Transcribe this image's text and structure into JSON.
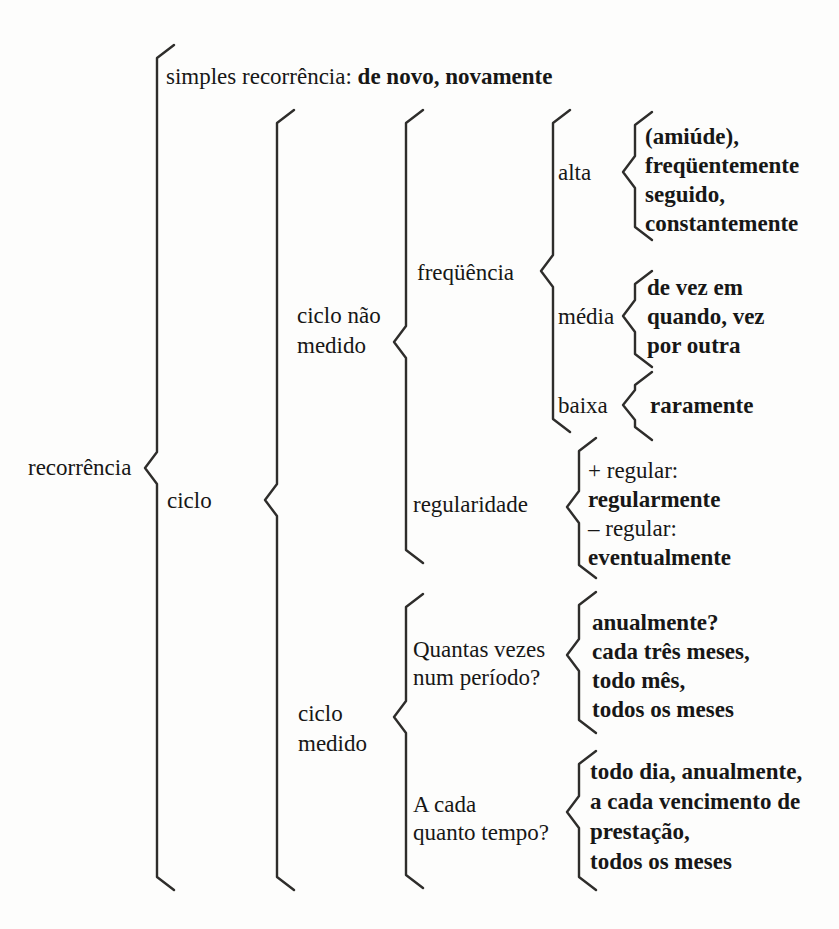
{
  "diagram": {
    "root": {
      "label": "recorrência"
    },
    "simples": {
      "prefix": "simples recorrência: ",
      "examples": "de novo, novamente"
    },
    "ciclo": {
      "label": "ciclo",
      "nao_medido": {
        "label_line1": "ciclo não",
        "label_line2": "medido",
        "frequencia": {
          "label": "freqüência",
          "alta": {
            "label": "alta",
            "items": [
              "(amiúde),",
              "freqüentemente",
              "seguido,",
              "constantemente"
            ]
          },
          "media": {
            "label": "média",
            "items": [
              "de vez em",
              "quando, vez",
              "por outra"
            ]
          },
          "baixa": {
            "label": "baixa",
            "items": [
              "raramente"
            ]
          }
        },
        "regularidade": {
          "label": "regularidade",
          "lines": [
            {
              "text": "+ regular:",
              "bold": false
            },
            {
              "text": "regularmente",
              "bold": true
            },
            {
              "text": "– regular:",
              "bold": false
            },
            {
              "text": "eventualmente",
              "bold": true
            }
          ]
        }
      },
      "medido": {
        "label_line1": "ciclo",
        "label_line2": "medido",
        "quantas_vezes": {
          "label_line1": "Quantas vezes",
          "label_line2": "num período?",
          "items": [
            "anualmente?",
            "cada três meses,",
            "todo mês,",
            "todos os meses"
          ]
        },
        "a_cada": {
          "label_line1": "A cada",
          "label_line2": "quanto tempo?",
          "items": [
            "todo dia, anualmente,",
            "a cada vencimento de",
            "prestação,",
            "todos os meses"
          ]
        }
      }
    }
  }
}
